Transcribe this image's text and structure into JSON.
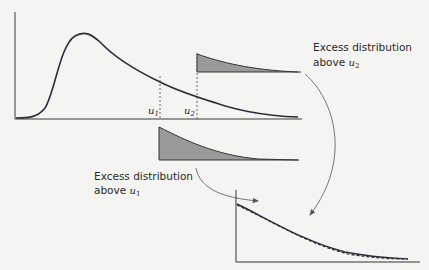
{
  "diagram": {
    "main_plot": {
      "description": "Heavy-tailed density with thresholds",
      "thresholds": [
        {
          "symbol": "u",
          "subscript": "1"
        },
        {
          "symbol": "u",
          "subscript": "2"
        }
      ]
    },
    "labels": {
      "excess_u2_line1": "Excess distribution",
      "excess_u2_line2": "above ",
      "excess_u2_symbol": "u",
      "excess_u2_sub": "2",
      "excess_u1_line1": "Excess distribution",
      "excess_u1_line2": "above ",
      "excess_u1_symbol": "u",
      "excess_u1_sub": "1"
    },
    "colors": {
      "curve": "#2b2b3a",
      "fill": "#9a9a9a",
      "axis": "#3a3a3a",
      "arrow": "#555555",
      "background": "#f4f4f2"
    }
  }
}
